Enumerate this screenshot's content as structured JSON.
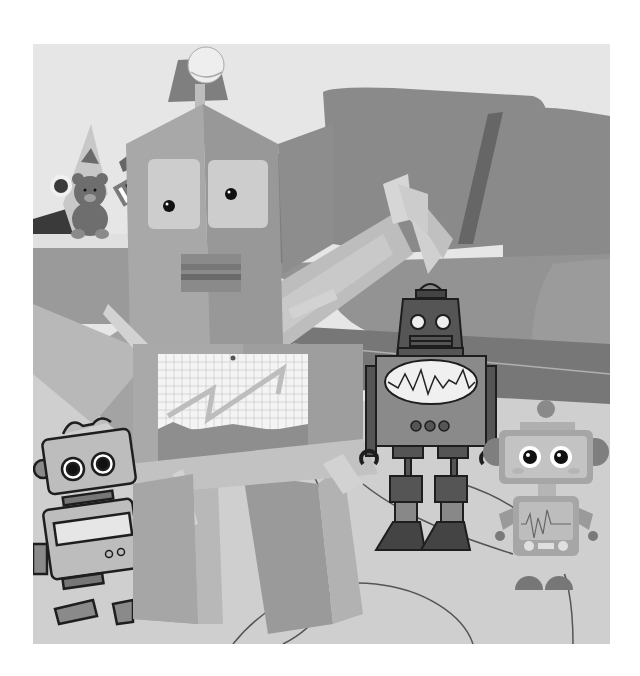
{
  "image": {
    "description": "Grayscale illustration: a large cardboard-box robot with a tennis-ball antenna in a living room, surrounded by three cartoon robots, a sofa and a toy shelf with a teddy bear.",
    "style": "grayscale flat vector collage",
    "bounds": {
      "x": 33,
      "y": 44,
      "width": 577,
      "height": 600
    }
  },
  "palette": {
    "wall": "#e6e6e6",
    "floor": "#cfcfcf",
    "sofa_back": "#8a8a8a",
    "sofa_seat": "#939393",
    "sofa_shadow": "#666666",
    "box_light": "#bdbdbd",
    "box_mid": "#a8a8a8",
    "box_dark": "#8f8f8f",
    "tape": "#d2d2d2",
    "paper": "#f4f4f4",
    "grid": "#c9c9c9",
    "outline": "#1e1e1e",
    "robot_dark": "#555555",
    "robot_mid": "#7a7a7a",
    "robot_light": "#b5b5b5",
    "screen": "#f0f0f0",
    "bear": "#6e6e6e",
    "lamp": "#7f7f7f",
    "ball": "#eeeeee"
  },
  "elements": {
    "background": {
      "wall": true,
      "floor_lines": 3
    },
    "sofa": {
      "cushions": 2,
      "arm": "right"
    },
    "toy_shelf": {
      "items": [
        "teddy-bear",
        "xylophone",
        "ball",
        "triangle-block",
        "star"
      ]
    },
    "box_robot": {
      "antenna": "tennis-ball",
      "eyes": 2,
      "mouth": "striped-rectangle",
      "chest": "graph-paper-with-zigzag",
      "legs": 2,
      "arm": "raised-right-box"
    },
    "robot_center": {
      "antenna_dome": true,
      "eyes": 2,
      "chest_screen": "waveform",
      "buttons": 3,
      "claw_hands": 2
    },
    "robot_right": {
      "antenna_ball": true,
      "eyes": 2,
      "chest_screen": "heartbeat",
      "ear_discs": 2,
      "feet": 2
    },
    "robot_left": {
      "eyes": 2,
      "chest_screen": "blank-panel",
      "buttons": 2
    }
  }
}
